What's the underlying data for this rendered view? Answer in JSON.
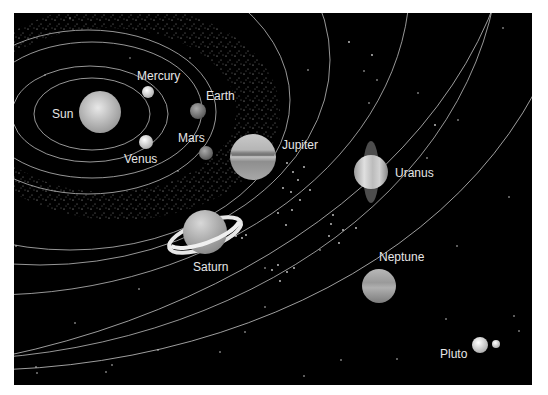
{
  "diagram": {
    "background_color": "#000000",
    "orbit_color": "#bdbdbd",
    "bodies": [
      {
        "name": "Sun",
        "label": "Sun",
        "cx": 100,
        "cy": 112,
        "r": 21,
        "label_x": 52,
        "label_y": 118
      },
      {
        "name": "Mercury",
        "label": "Mercury",
        "cx": 148,
        "cy": 92,
        "r": 6,
        "label_x": 137,
        "label_y": 80
      },
      {
        "name": "Venus",
        "label": "Venus",
        "cx": 146,
        "cy": 142,
        "r": 7,
        "label_x": 124,
        "label_y": 163
      },
      {
        "name": "Earth",
        "label": "Earth",
        "cx": 198,
        "cy": 111,
        "r": 8,
        "label_x": 206,
        "label_y": 100
      },
      {
        "name": "Mars",
        "label": "Mars",
        "cx": 206,
        "cy": 153,
        "r": 7,
        "label_x": 178,
        "label_y": 142
      },
      {
        "name": "Jupiter",
        "label": "Jupiter",
        "cx": 253,
        "cy": 157,
        "r": 23,
        "label_x": 282,
        "label_y": 149
      },
      {
        "name": "Saturn",
        "label": "Saturn",
        "cx": 205,
        "cy": 232,
        "r": 22,
        "label_x": 193,
        "label_y": 271
      },
      {
        "name": "Uranus",
        "label": "Uranus",
        "cx": 371,
        "cy": 172,
        "r": 17,
        "label_x": 395,
        "label_y": 177
      },
      {
        "name": "Neptune",
        "label": "Neptune",
        "cx": 379,
        "cy": 286,
        "r": 17,
        "label_x": 379,
        "label_y": 261
      },
      {
        "name": "Pluto",
        "label": "Pluto",
        "cx": 480,
        "cy": 345,
        "r": 8,
        "label_x": 440,
        "label_y": 358
      },
      {
        "name": "Charon",
        "label": "",
        "cx": 496,
        "cy": 344,
        "r": 4,
        "label_x": 0,
        "label_y": 0
      }
    ]
  }
}
